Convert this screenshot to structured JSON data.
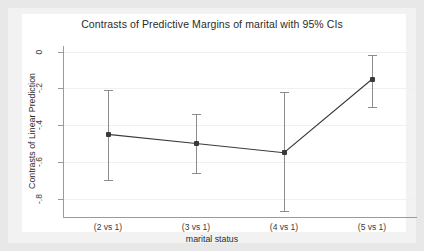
{
  "chart_data": {
    "type": "line",
    "title": "Contrasts of Predictive Margins of marital with 95% CIs",
    "xlabel": "marital status",
    "ylabel": "Contrasts of Linear Prediction",
    "categories": [
      "(2 vs 1)",
      "(3 vs 1)",
      "(4 vs 1)",
      "(5 vs 1)"
    ],
    "values": [
      -0.45,
      -0.5,
      -0.55,
      -0.15
    ],
    "ci_low": [
      -0.7,
      -0.66,
      -0.87,
      -0.3
    ],
    "ci_high": [
      -0.21,
      -0.34,
      -0.22,
      -0.02
    ],
    "ylim": [
      -0.9,
      0.02
    ],
    "ytick_values": [
      0,
      -0.2,
      -0.4,
      -0.6,
      -0.8
    ],
    "ytick_labels": [
      "0",
      "-.2",
      "-.4",
      "-.6",
      "-.8"
    ],
    "grid": true,
    "legend": "none",
    "series": [
      {
        "name": "Contrasts of Linear Prediction",
        "values": [
          -0.45,
          -0.5,
          -0.55,
          -0.15
        ],
        "marker": "square",
        "color": "#3a3a3a"
      }
    ],
    "colors": {
      "line": "#3a3a3a",
      "marker": "#3a3a3a",
      "errorbar": "#8c8c8c",
      "grid": "#f0f0f0",
      "axis": "#9a9a9a",
      "plot_background": "#ffffff",
      "graph_background": "#f2f2f2",
      "outer_background": "#e8e8e8",
      "text": "#2b2b2b"
    }
  }
}
